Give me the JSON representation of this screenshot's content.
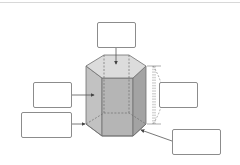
{
  "diagram": {
    "title": "",
    "colors": {
      "face_light": "#d9d9d9",
      "face_mid": "#c4c4c4",
      "face_dark": "#ababab",
      "edge": "#6e6e6e",
      "arrow": "#555555",
      "box_border": "#8c8c8c"
    },
    "label_boxes": [
      {
        "id": "top",
        "text": "",
        "points_to": "top face (base)"
      },
      {
        "id": "left-upper",
        "text": "",
        "points_to": "lateral face"
      },
      {
        "id": "left-lower",
        "text": "",
        "points_to": "vertex"
      },
      {
        "id": "right-middle",
        "text": "",
        "points_to": "height"
      },
      {
        "id": "right-bottom",
        "text": "",
        "points_to": "edge"
      }
    ]
  }
}
